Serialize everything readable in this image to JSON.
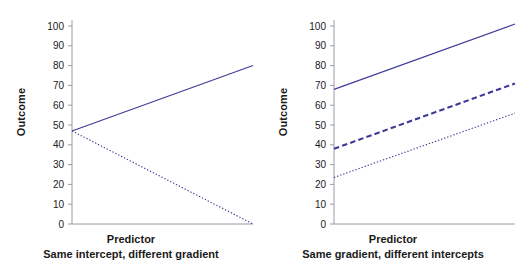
{
  "figure": {
    "background": "#ffffff",
    "line_color": "#3b3b96",
    "axis_color": "#9a9aa8",
    "text_color": "#1a1a1a"
  },
  "chart_data": [
    {
      "type": "line",
      "panel": "left",
      "title": "",
      "xlabel": "Predictor",
      "ylabel": "Outcome",
      "subtitle": "Same intercept, different gradient",
      "xlim": [
        0,
        1
      ],
      "ylim": [
        0,
        105
      ],
      "yticks": [
        0,
        10,
        20,
        30,
        40,
        50,
        60,
        70,
        80,
        90,
        100
      ],
      "ytick_labels": [
        "0",
        "10",
        "20",
        "30",
        "40",
        "50",
        "60",
        "70",
        "80",
        "90",
        "100"
      ],
      "xticks": [],
      "xtick_labels": [],
      "grid": false,
      "legend": "none",
      "x": [
        0,
        1
      ],
      "series": [
        {
          "name": "positive gradient",
          "style": "solid",
          "width": 1.1,
          "values": [
            47,
            80
          ]
        },
        {
          "name": "negative gradient",
          "style": "dotted",
          "width": 1.1,
          "values": [
            47,
            0
          ]
        }
      ]
    },
    {
      "type": "line",
      "panel": "right",
      "title": "",
      "xlabel": "Predictor",
      "ylabel": "Outcome",
      "subtitle": "Same gradient, different intercepts",
      "xlim": [
        0,
        1
      ],
      "ylim": [
        0,
        105
      ],
      "yticks": [
        0,
        10,
        20,
        30,
        40,
        50,
        60,
        70,
        80,
        90,
        100
      ],
      "ytick_labels": [
        "0",
        "10",
        "20",
        "30",
        "40",
        "50",
        "60",
        "70",
        "80",
        "90",
        "100"
      ],
      "xticks": [],
      "xtick_labels": [],
      "grid": false,
      "legend": "none",
      "x": [
        0,
        1
      ],
      "series": [
        {
          "name": "high intercept",
          "style": "solid",
          "width": 1.1,
          "values": [
            68,
            101
          ]
        },
        {
          "name": "middle intercept",
          "style": "dashed",
          "width": 2.1,
          "values": [
            38,
            71
          ]
        },
        {
          "name": "low intercept",
          "style": "dotted",
          "width": 1.1,
          "values": [
            23.5,
            56
          ]
        }
      ]
    }
  ]
}
